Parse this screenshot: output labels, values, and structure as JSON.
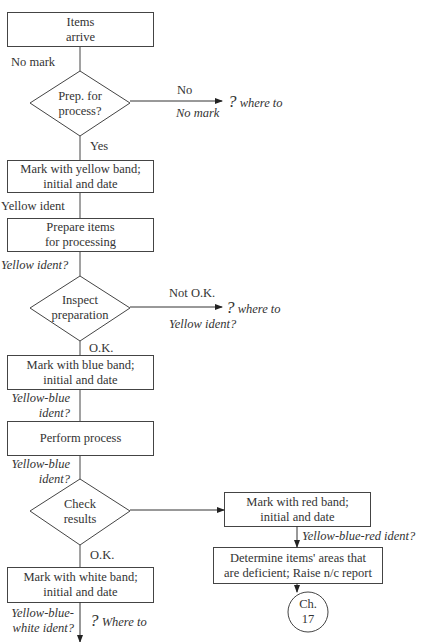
{
  "diagram": {
    "type": "flowchart",
    "nodes": {
      "start": {
        "line1": "Items",
        "line2": "arrive"
      },
      "decision_prep": {
        "line1": "Prep. for",
        "line2": "process?"
      },
      "mark_yellow": {
        "line1": "Mark with yellow band;",
        "line2": "initial and date"
      },
      "prepare": {
        "line1": "Prepare items",
        "line2": "for processing"
      },
      "decision_inspect": {
        "line1": "Inspect",
        "line2": "preparation"
      },
      "mark_blue": {
        "line1": "Mark with blue band;",
        "line2": "initial and date"
      },
      "perform": {
        "line1": "Perform process"
      },
      "decision_check": {
        "line1": "Check",
        "line2": "results"
      },
      "mark_red": {
        "line1": "Mark with red band;",
        "line2": "initial and date"
      },
      "determine": {
        "line1": "Determine items' areas that",
        "line2": "are deficient; Raise n/c report"
      },
      "connector": {
        "line1": "Ch.",
        "line2": "17"
      },
      "mark_white": {
        "line1": "Mark with white band;",
        "line2": "initial and date"
      }
    },
    "labels": {
      "no_mark_1": "No mark",
      "no": "No",
      "no_mark_italic": "No mark",
      "where_to_q": "?",
      "where_to": "where to",
      "yes": "Yes",
      "yellow_ident": "Yellow ident",
      "yellow_ident_q": "Yellow ident?",
      "not_ok": "Not O.K.",
      "yellow_ident_q2": "Yellow ident?",
      "ok_1": "O.K.",
      "yellow_blue_ident_1a": "Yellow-blue",
      "yellow_blue_ident_1b": "ident?",
      "yellow_blue_ident_2a": "Yellow-blue",
      "yellow_blue_ident_2b": "ident?",
      "yellow_blue_red_ident": "Yellow-blue-red ident?",
      "ok_2": "O.K.",
      "yellow_blue_white_a": "Yellow-blue-",
      "yellow_blue_white_b": "white ident?",
      "where_to_cap": "Where to"
    }
  }
}
